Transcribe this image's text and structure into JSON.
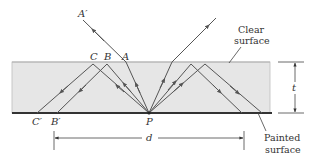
{
  "diagram": {
    "labels": {
      "a_prime": "A′",
      "a": "A",
      "b": "B",
      "c": "C",
      "b_prime": "B′",
      "c_prime": "C′",
      "p": "P",
      "d": "d",
      "t": "t"
    },
    "annotations": {
      "clear_surface_line1": "Clear",
      "clear_surface_line2": "surface",
      "painted_surface_line1": "Painted",
      "painted_surface_line2": "surface"
    },
    "colors": {
      "slab_fill": "#e6e6e6",
      "slab_edge": "#bdbdbd",
      "ray": "#555555",
      "painted": "#333333"
    }
  }
}
